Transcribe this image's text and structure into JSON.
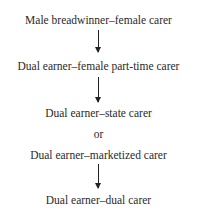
{
  "diagram": {
    "nodes": [
      {
        "label": "Male breadwinner–female carer"
      },
      {
        "label": "Dual earner–female part-time carer"
      },
      {
        "label": "Dual earner–state carer"
      },
      {
        "label": "or"
      },
      {
        "label": "Dual earner–marketized carer"
      },
      {
        "label": "Dual earner–dual carer"
      }
    ],
    "edges": [
      {
        "from": 0,
        "to": 1
      },
      {
        "from": 1,
        "to": "2|4"
      },
      {
        "from": "2|4",
        "to": 5
      }
    ]
  }
}
